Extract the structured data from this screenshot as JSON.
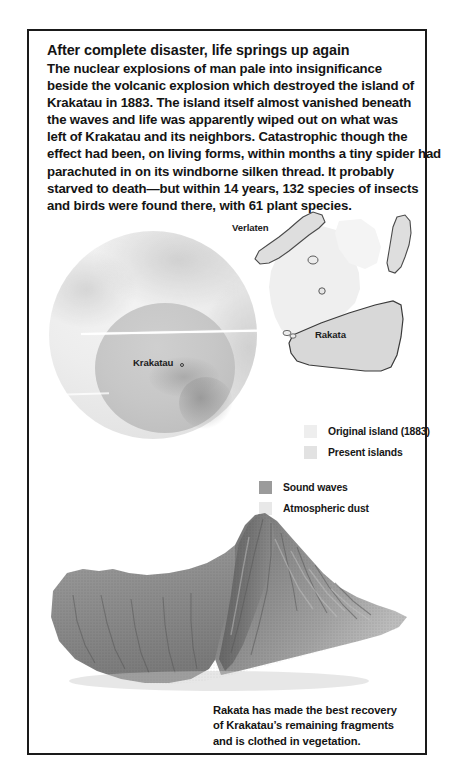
{
  "article": {
    "headline": "After complete disaster, life springs up again",
    "body_lines": [
      "The nuclear explosions of man pale into insignificance",
      "beside the volcanic explosion which destroyed the island of",
      "Krakatau in 1883. The island itself almost vanished beneath",
      "the waves and life was apparently wiped out on what was",
      "left of Krakatau and its neighbors. Catastrophic though the",
      "effect had been, on living forms, within months a tiny spider had",
      "parachuted in on its windborne silken thread. It probably",
      "starved to death—but within 14 years, 132 species of insects",
      "and birds were found there, with 61 plant species."
    ]
  },
  "diagram": {
    "globe_label": "Krakatau",
    "map_labels": {
      "verlaten": "Verlaten",
      "rakata": "Rakata"
    }
  },
  "legend_islands": {
    "items": [
      {
        "label": "Original island (1883)",
        "color": "#eeeeee"
      },
      {
        "label": "Present islands",
        "color": "#e2e2e2"
      }
    ]
  },
  "legend_waves": {
    "items": [
      {
        "label": "Sound waves",
        "color": "#9b9b9b"
      },
      {
        "label": "Atmospheric dust",
        "color": "#e8e8e8"
      }
    ]
  },
  "caption": {
    "lines": [
      "Rakata has made the best recovery",
      "of Krakatau’s remaining fragments",
      "and is clothed in vegetation."
    ]
  }
}
